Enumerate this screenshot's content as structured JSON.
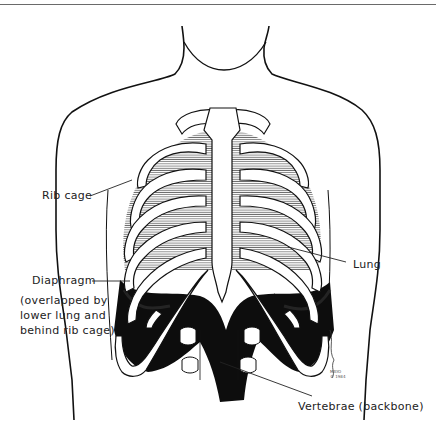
{
  "figure": {
    "labels": {
      "rib_cage": "Rib cage",
      "diaphragm": "Diaphragm",
      "diaphragm_note": "(overlapped by\nlower lung and\nbehind rib cage)",
      "lung": "Lung",
      "vertebrae": "Vertebrae (backbone)"
    },
    "signature": "MAYO\n© 1984"
  },
  "colors": {
    "ink": "#111111",
    "label_text": "#222222",
    "background": "#ffffff",
    "rule": "#6a6a6a"
  }
}
